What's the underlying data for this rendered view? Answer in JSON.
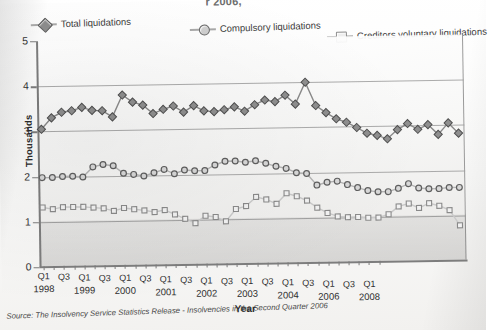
{
  "figure": {
    "title_fragment": "r 2006,",
    "y_axis_title": "Thousands",
    "x_axis_title": "Year",
    "source_note": "Source: The Insolvency Service Statistics Release - Insolvencies in the Second Quarter 2006"
  },
  "legend": {
    "items": [
      {
        "label": "Total liquidations",
        "marker": "diamond-marker-icon",
        "color": "#8d8d8d"
      },
      {
        "label": "Compulsory liquidations",
        "marker": "circle-marker-icon",
        "color": "#cfcfcf"
      },
      {
        "label": "Creditors voluntary liquidations",
        "marker": "square-marker-icon",
        "color": "#ededed"
      }
    ]
  },
  "chart_data": {
    "type": "line",
    "title": "r 2006,",
    "xlabel": "Year",
    "ylabel": "Thousands",
    "ylim": [
      0,
      5
    ],
    "yticks": [
      0,
      1,
      2,
      3,
      4,
      5
    ],
    "grid": "horizontal",
    "legend_position": "top",
    "x": [
      "Q1 1998",
      "Q2 1998",
      "Q3 1998",
      "Q4 1998",
      "Q1 1999",
      "Q2 1999",
      "Q3 1999",
      "Q4 1999",
      "Q1 2000",
      "Q2 2000",
      "Q3 2000",
      "Q4 2000",
      "Q1 2001",
      "Q2 2001",
      "Q3 2001",
      "Q4 2001",
      "Q1 2002",
      "Q2 2002",
      "Q3 2002",
      "Q4 2002",
      "Q1 2003",
      "Q2 2003",
      "Q3 2003",
      "Q4 2003",
      "Q1 2004",
      "Q2 2004",
      "Q3 2004",
      "Q4 2004",
      "Q1 2005",
      "Q2 2005",
      "Q3 2005",
      "Q4 2005",
      "Q1 2006",
      "Q2 2006",
      "Q3 2006",
      "Q4 2006",
      "Q1 2007",
      "Q2 2007",
      "Q3 2007",
      "Q4 2007",
      "Q1 2008",
      "Q2 2008"
    ],
    "x_tick_labels": [
      {
        "label": "Q1",
        "year": "1998"
      },
      {
        "label": "",
        "year": ""
      },
      {
        "label": "Q3",
        "year": ""
      },
      {
        "label": "",
        "year": ""
      },
      {
        "label": "Q1",
        "year": "1999"
      },
      {
        "label": "",
        "year": ""
      },
      {
        "label": "Q3",
        "year": ""
      },
      {
        "label": "",
        "year": ""
      },
      {
        "label": "Q1",
        "year": "2000"
      },
      {
        "label": "",
        "year": ""
      },
      {
        "label": "Q3",
        "year": ""
      },
      {
        "label": "",
        "year": ""
      },
      {
        "label": "Q1",
        "year": "2001"
      },
      {
        "label": "",
        "year": ""
      },
      {
        "label": "Q3",
        "year": ""
      },
      {
        "label": "",
        "year": ""
      },
      {
        "label": "Q1",
        "year": "2002"
      },
      {
        "label": "",
        "year": ""
      },
      {
        "label": "Q3",
        "year": ""
      },
      {
        "label": "",
        "year": ""
      },
      {
        "label": "Q1",
        "year": "2003"
      },
      {
        "label": "",
        "year": ""
      },
      {
        "label": "Q3",
        "year": ""
      },
      {
        "label": "",
        "year": ""
      },
      {
        "label": "Q1",
        "year": "2004"
      },
      {
        "label": "",
        "year": ""
      },
      {
        "label": "Q3",
        "year": ""
      },
      {
        "label": "",
        "year": ""
      },
      {
        "label": "Q1",
        "year": "2006"
      },
      {
        "label": "",
        "year": ""
      },
      {
        "label": "Q3",
        "year": ""
      },
      {
        "label": "",
        "year": ""
      },
      {
        "label": "Q1",
        "year": "2008"
      },
      {
        "label": "",
        "year": ""
      }
    ],
    "series": [
      {
        "name": "Total liquidations",
        "marker": "diamond",
        "values": [
          3.05,
          3.3,
          3.42,
          3.45,
          3.52,
          3.45,
          3.44,
          3.3,
          3.78,
          3.62,
          3.55,
          3.36,
          3.45,
          3.52,
          3.38,
          3.52,
          3.4,
          3.38,
          3.42,
          3.48,
          3.38,
          3.52,
          3.62,
          3.58,
          3.72,
          3.52,
          4.0,
          3.48,
          3.32,
          3.18,
          3.1,
          2.98,
          2.85,
          2.8,
          2.72,
          2.92,
          3.05,
          2.92,
          3.02,
          2.8,
          3.05,
          2.82
        ]
      },
      {
        "name": "Compulsory liquidations",
        "marker": "circle",
        "values": [
          1.98,
          1.98,
          2.0,
          2.0,
          1.98,
          2.2,
          2.25,
          2.22,
          2.05,
          2.02,
          1.98,
          2.05,
          2.12,
          2.02,
          2.1,
          2.08,
          2.08,
          2.2,
          2.28,
          2.28,
          2.25,
          2.28,
          2.22,
          2.15,
          2.1,
          2.0,
          1.98,
          1.72,
          1.78,
          1.8,
          1.72,
          1.65,
          1.58,
          1.55,
          1.55,
          1.62,
          1.72,
          1.62,
          1.6,
          1.6,
          1.62,
          1.62
        ]
      },
      {
        "name": "Creditors voluntary liquidations",
        "marker": "square",
        "values": [
          1.32,
          1.28,
          1.32,
          1.32,
          1.32,
          1.3,
          1.28,
          1.22,
          1.28,
          1.25,
          1.22,
          1.18,
          1.22,
          1.12,
          1.02,
          0.92,
          1.08,
          1.05,
          0.95,
          1.22,
          1.28,
          1.48,
          1.42,
          1.32,
          1.55,
          1.48,
          1.38,
          1.22,
          1.1,
          1.02,
          1.0,
          1.0,
          0.98,
          0.98,
          1.05,
          1.22,
          1.28,
          1.18,
          1.28,
          1.22,
          1.12,
          0.78
        ]
      }
    ]
  }
}
